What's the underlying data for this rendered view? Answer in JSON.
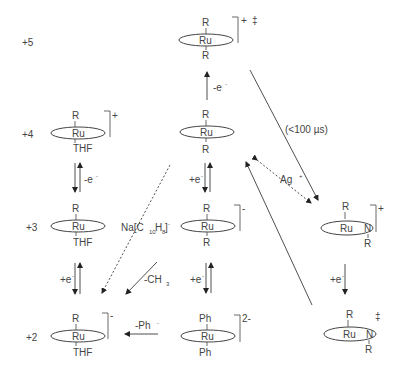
{
  "oxidation_states": [
    "+5",
    "+4",
    "+3",
    "+2"
  ],
  "complexes": {
    "ru5_center": {
      "top": "R",
      "metal": "Ru",
      "bottom": "R",
      "charge": "+",
      "extra": "‡"
    },
    "ru4_left": {
      "top": "R",
      "metal": "Ru",
      "bottom": "THF",
      "charge": "+"
    },
    "ru4_center": {
      "top": "R",
      "metal": "Ru",
      "bottom": "R"
    },
    "ru3_left": {
      "top": "R",
      "metal": "Ru",
      "bottom": "THF"
    },
    "ru3_center": {
      "top": "R",
      "metal": "Ru",
      "bottom": "R",
      "charge": "-"
    },
    "ru3_right": {
      "top": "R",
      "metal": "Ru",
      "side": "N",
      "bottom": "R",
      "charge": "+"
    },
    "ru2_left": {
      "top": "R",
      "metal": "Ru",
      "bottom": "THF",
      "charge": "-"
    },
    "ru2_center": {
      "top": "Ph",
      "metal": "Ru",
      "bottom": "Ph",
      "charge": "2-"
    },
    "ru2_right": {
      "top": "R",
      "metal": "Ru",
      "side": "N",
      "bottom": "R",
      "extra": "‡"
    }
  },
  "arrow_labels": {
    "minus_e_top": "-e",
    "minus_e_left": "-e",
    "plus_e_center1": "+e",
    "plus_e_center2": "+e",
    "plus_e_left": "+e",
    "plus_e_right": "+e",
    "timescale": "(<100 µs)",
    "silver": "Ag",
    "reductant": "Na[C",
    "reductant_sub1": "10",
    "reductant_mid": "H",
    "reductant_sub2": "8",
    "reductant_end": "]",
    "methyl_loss": "-CH",
    "methyl_sub": "3",
    "phenyl_loss": "-Ph"
  }
}
